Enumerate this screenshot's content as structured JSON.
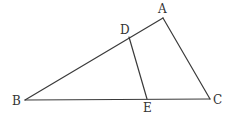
{
  "diagram": {
    "type": "geometry-triangle",
    "points": {
      "A": {
        "label": "A",
        "x": 163,
        "y": 18,
        "lx": 158,
        "ly": 13
      },
      "B": {
        "label": "B",
        "x": 25,
        "y": 100,
        "lx": 12,
        "ly": 105
      },
      "C": {
        "label": "C",
        "x": 210,
        "y": 99,
        "lx": 213,
        "ly": 104
      },
      "D": {
        "label": "D",
        "x": 129,
        "y": 37,
        "lx": 120,
        "ly": 34
      },
      "E": {
        "label": "E",
        "x": 147,
        "y": 99,
        "lx": 143,
        "ly": 112
      }
    },
    "segments": [
      [
        "A",
        "B"
      ],
      [
        "B",
        "C"
      ],
      [
        "C",
        "A"
      ],
      [
        "D",
        "E"
      ]
    ],
    "colors": {
      "line": "#3a3a3a",
      "text": "#333333",
      "background": "#ffffff"
    }
  }
}
